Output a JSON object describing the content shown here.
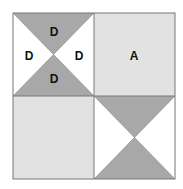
{
  "diagram": {
    "colors": {
      "dark": "#a8a8a8",
      "light": "#e2e2e2",
      "white": "#ffffff",
      "line": "#777777"
    },
    "quadrants": [
      {
        "position": "top-left",
        "type": "hourglass",
        "labels": {
          "top": "D",
          "left": "D",
          "right": "D",
          "bottom": "D"
        }
      },
      {
        "position": "top-right",
        "type": "solid",
        "label": "A"
      },
      {
        "position": "bottom-left",
        "type": "solid",
        "label": ""
      },
      {
        "position": "bottom-right",
        "type": "hourglass",
        "labels": {
          "top": "",
          "left": "",
          "right": "",
          "bottom": ""
        }
      }
    ]
  }
}
